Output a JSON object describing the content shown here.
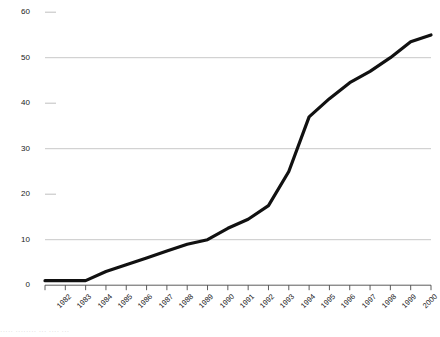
{
  "chart_data": {
    "type": "line",
    "title": "",
    "subtitle": "",
    "xlabel": "",
    "ylabel": "",
    "x": [
      1982,
      1983,
      1984,
      1985,
      1986,
      1987,
      1988,
      1989,
      1990,
      1991,
      1992,
      1993,
      1994,
      1995,
      1996,
      1997,
      1998,
      1999,
      2000,
      2001
    ],
    "categories": [
      "1982",
      "1983",
      "1984",
      "1985",
      "1986",
      "1987",
      "1988",
      "1989",
      "1990",
      "1991",
      "1992",
      "1993",
      "1994",
      "1995",
      "1996",
      "1997",
      "1998",
      "1999",
      "2000",
      "2001"
    ],
    "values": [
      1,
      1,
      1,
      3,
      4.5,
      6,
      7.5,
      9,
      10,
      12.5,
      14.5,
      17.5,
      25,
      37,
      41,
      44.5,
      47,
      50,
      53.5,
      55
    ],
    "series": [
      {
        "name": "series-1",
        "values": [
          1,
          1,
          1,
          3,
          4.5,
          6,
          7.5,
          9,
          10,
          12.5,
          14.5,
          17.5,
          25,
          37,
          41,
          44.5,
          47,
          50,
          53.5,
          55
        ]
      }
    ],
    "ylim": [
      0,
      60
    ],
    "yticks": [
      0,
      10,
      20,
      30,
      40,
      50,
      60
    ],
    "ytick_labels": [
      "0",
      "10",
      "20",
      "30",
      "40",
      "50",
      "60"
    ],
    "gridline_values": [
      10,
      30,
      50
    ],
    "tickmark_only_values": [
      20,
      40,
      60
    ],
    "grid": true,
    "legend": false,
    "legend_position": "none",
    "line_color": "#111111",
    "grid_color": "#b9b9b9",
    "axis_color": "#555555"
  },
  "footer": {
    "ghost_text": "·····      ········        ···  ····                      ···"
  }
}
